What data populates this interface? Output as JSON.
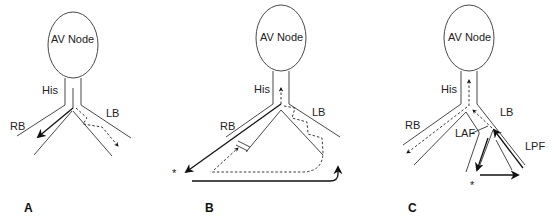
{
  "panels": [
    {
      "id": "A",
      "label": "A",
      "node_label": "AV Node",
      "labels": {
        "his": "His",
        "rb": "RB",
        "lb": "LB"
      }
    },
    {
      "id": "B",
      "label": "B",
      "node_label": "AV Node",
      "labels": {
        "his": "His",
        "rb": "RB",
        "lb": "LB"
      },
      "markers": {
        "star": "*"
      }
    },
    {
      "id": "C",
      "label": "C",
      "node_label": "AV Node",
      "labels": {
        "his": "His",
        "rb": "RB",
        "lb": "LB",
        "laf": "LAF",
        "lpf": "LPF"
      },
      "markers": {
        "star": "*"
      }
    }
  ]
}
